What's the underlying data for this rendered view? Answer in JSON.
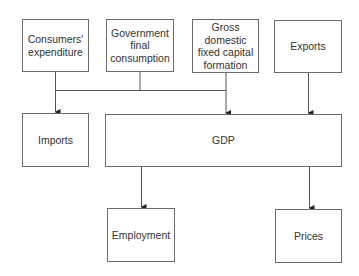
{
  "diagram": {
    "title": "",
    "nodes": {
      "consumers": {
        "label": "Consumers'\nexpenditure"
      },
      "government": {
        "label": "Government\nfinal\nconsumption"
      },
      "gross": {
        "label": "Gross\ndomestic\nfixed capital\nformation"
      },
      "exports": {
        "label": "Exports"
      },
      "imports": {
        "label": "Imports"
      },
      "gdp": {
        "label": "GDP"
      },
      "employment": {
        "label": "Employment"
      },
      "prices": {
        "label": "Prices"
      }
    },
    "edges": [
      {
        "from": "consumers",
        "to": "bus"
      },
      {
        "from": "government",
        "to": "bus"
      },
      {
        "from": "gross",
        "to": "bus"
      },
      {
        "from": "bus",
        "to": "imports"
      },
      {
        "from": "bus",
        "to": "gdp"
      },
      {
        "from": "exports",
        "to": "gdp"
      },
      {
        "from": "gdp",
        "to": "employment"
      },
      {
        "from": "gdp",
        "to": "prices"
      }
    ],
    "colors": {
      "line": "#555555",
      "border": "#6b6b6b",
      "text": "#333333"
    }
  }
}
